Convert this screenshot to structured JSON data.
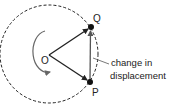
{
  "diagram": {
    "labels": {
      "center": "O",
      "point_q": "Q",
      "point_p": "P"
    },
    "annotation": {
      "line1": "change in",
      "line2": "displacement"
    },
    "colors": {
      "stroke": "#222222",
      "vector_pq": "#555555",
      "rotation_arrow": "#666666",
      "background": "#ffffff"
    }
  }
}
